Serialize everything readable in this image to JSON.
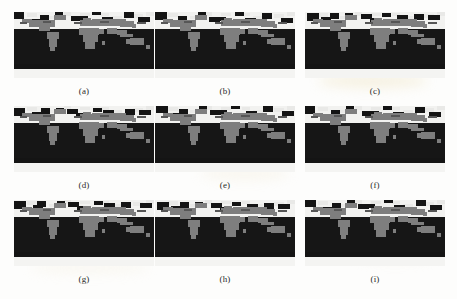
{
  "figure": {
    "type": "multi-panel-figure",
    "panel_count": 9,
    "rows": 3,
    "columns": 3,
    "projection": "equirectangular world map",
    "colors": {
      "ocean": "#161616",
      "land": "#7e7e7e",
      "polar_ice": "#f2f2f0",
      "page_background": "#fdfdfc",
      "caption_text": "#2a2a2a"
    },
    "panels": [
      {
        "id": "panel-a",
        "caption": "(a)",
        "row": 1,
        "column": 1
      },
      {
        "id": "panel-b",
        "caption": "(b)",
        "row": 1,
        "column": 2
      },
      {
        "id": "panel-c",
        "caption": "(c)",
        "row": 1,
        "column": 3
      },
      {
        "id": "panel-d",
        "caption": "(d)",
        "row": 2,
        "column": 1
      },
      {
        "id": "panel-e",
        "caption": "(e)",
        "row": 2,
        "column": 2
      },
      {
        "id": "panel-f",
        "caption": "(f)",
        "row": 2,
        "column": 3
      },
      {
        "id": "panel-g",
        "caption": "(g)",
        "row": 3,
        "column": 1
      },
      {
        "id": "panel-h",
        "caption": "(h)",
        "row": 3,
        "column": 2
      },
      {
        "id": "panel-i",
        "caption": "(i)",
        "row": 3,
        "column": 3
      }
    ]
  }
}
